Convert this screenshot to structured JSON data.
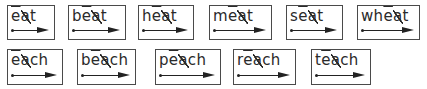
{
  "rows": [
    {
      "cards": [
        {
          "pre": "",
          "vowel": "e",
          "silent": "a",
          "post": "t",
          "word": "eat"
        },
        {
          "pre": "b",
          "vowel": "e",
          "silent": "a",
          "post": "t",
          "word": "beat"
        },
        {
          "pre": "h",
          "vowel": "e",
          "silent": "a",
          "post": "t",
          "word": "heat"
        },
        {
          "pre": "m",
          "vowel": "e",
          "silent": "a",
          "post": "t",
          "word": "meat"
        },
        {
          "pre": "s",
          "vowel": "e",
          "silent": "a",
          "post": "t",
          "word": "seat"
        },
        {
          "pre": "wh",
          "vowel": "e",
          "silent": "a",
          "post": "t",
          "word": "wheat"
        }
      ]
    },
    {
      "cards": [
        {
          "pre": "",
          "vowel": "e",
          "silent": "a",
          "post": "ch",
          "word": "each"
        },
        {
          "pre": "b",
          "vowel": "e",
          "silent": "a",
          "post": "ch",
          "word": "beach"
        },
        {
          "pre": "p",
          "vowel": "e",
          "silent": "a",
          "post": "ch",
          "word": "peach"
        },
        {
          "pre": "r",
          "vowel": "e",
          "silent": "a",
          "post": "ch",
          "word": "reach"
        },
        {
          "pre": "t",
          "vowel": "e",
          "silent": "a",
          "post": "ch",
          "word": "teach"
        }
      ]
    }
  ],
  "notation": {
    "long_vowel_mark": "macron",
    "silent_letter_mark": "slash",
    "reading_guide": "dot-arrow"
  }
}
